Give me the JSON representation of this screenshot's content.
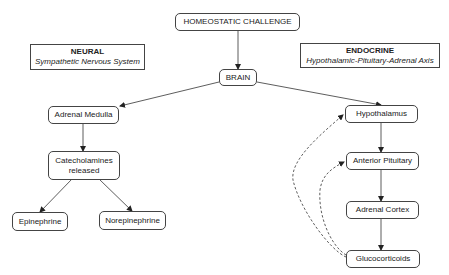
{
  "nodes": {
    "challenge": "HOMEOSTATIC CHALLENGE",
    "brain": "BRAIN",
    "adrenal_medulla": "Adrenal Medulla",
    "catecholamines": "Catecholamines released",
    "epinephrine": "Epinephrine",
    "norepinephrine": "Norepinephrine",
    "hypothalamus": "Hypothalamus",
    "anterior_pituitary": "Anterior Pituitary",
    "adrenal_cortex": "Adrenal Cortex",
    "glucocorticoids": "Glucocorticoids"
  },
  "labels": {
    "neural": {
      "title": "NEURAL",
      "subtitle": "Sympathetic Nervous System"
    },
    "endocrine": {
      "title": "ENDOCRINE",
      "subtitle": "Hypothalamic-Pituitary-Adrenal Axis"
    }
  },
  "edges": [
    {
      "from": "challenge",
      "to": "brain",
      "style": "solid"
    },
    {
      "from": "brain",
      "to": "adrenal_medulla",
      "style": "solid"
    },
    {
      "from": "brain",
      "to": "hypothalamus",
      "style": "solid"
    },
    {
      "from": "adrenal_medulla",
      "to": "catecholamines",
      "style": "solid"
    },
    {
      "from": "catecholamines",
      "to": "epinephrine",
      "style": "solid"
    },
    {
      "from": "catecholamines",
      "to": "norepinephrine",
      "style": "solid"
    },
    {
      "from": "hypothalamus",
      "to": "anterior_pituitary",
      "style": "solid"
    },
    {
      "from": "anterior_pituitary",
      "to": "adrenal_cortex",
      "style": "solid"
    },
    {
      "from": "adrenal_cortex",
      "to": "glucocorticoids",
      "style": "solid"
    },
    {
      "from": "glucocorticoids",
      "to": "hypothalamus",
      "style": "dashed",
      "type": "negative-feedback"
    },
    {
      "from": "glucocorticoids",
      "to": "anterior_pituitary",
      "style": "dashed",
      "type": "negative-feedback"
    }
  ]
}
